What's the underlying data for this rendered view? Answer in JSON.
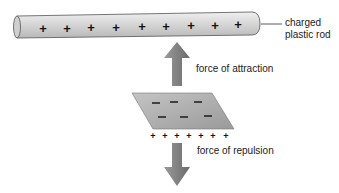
{
  "labels": {
    "rod_line1": "charged",
    "rod_line2": "plastic rod",
    "attraction": "force of attraction",
    "repulsion": "force of repulsion"
  },
  "rod": {
    "charge_symbol": "+",
    "charge_count": 9
  },
  "plate": {
    "top_charge_symbol": "−",
    "top_charge_count": 6,
    "bottom_charge_symbol": "+",
    "bottom_charge_count": 7
  },
  "colors": {
    "rod": "#d6d6d6",
    "plate": "#a8a8a8",
    "arrow": "#7d7d7d"
  }
}
